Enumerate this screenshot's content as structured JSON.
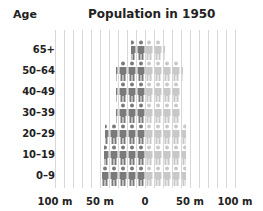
{
  "header": {
    "age_label": "Age",
    "title": "Population in 1950"
  },
  "colors": {
    "male": "#7a7a7a",
    "female": "#c8c8c8",
    "grid": "#d8d8d8"
  },
  "chart_data": {
    "type": "bar",
    "title": "Population in 1950",
    "subtitle": "",
    "xlabel": "",
    "ylabel": "Age",
    "categories": [
      "65+",
      "50–64",
      "40–49",
      "30–39",
      "20–29",
      "10–19",
      "0–9"
    ],
    "series": [
      {
        "name": "Male (left)",
        "values": [
          16,
          32,
          32,
          32,
          44,
          46,
          48
        ]
      },
      {
        "name": "Female (right)",
        "values": [
          22,
          42,
          40,
          40,
          46,
          46,
          46
        ]
      }
    ],
    "xticks": [
      "100 m",
      "50 m",
      "0",
      "50 m",
      "100 m"
    ],
    "xlim": [
      -120,
      120
    ],
    "unit": "million",
    "icon": "person-pictogram",
    "grid": true,
    "legend": "none"
  },
  "ylabels": [
    "65+",
    "50–64",
    "40–49",
    "30–39",
    "20–29",
    "10–19",
    "0–9"
  ],
  "xticks": [
    "100 m",
    "50 m",
    "0",
    "50 m",
    "100 m"
  ]
}
